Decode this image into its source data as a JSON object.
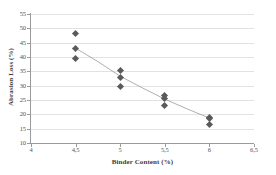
{
  "chart_data": {
    "type": "scatter",
    "title": "",
    "xlabel": "Binder Content (%)",
    "ylabel": "Abrasion Loss (%)",
    "xlim": [
      4,
      6.5
    ],
    "ylim": [
      10,
      55
    ],
    "xticks": [
      4,
      4.5,
      5,
      5.5,
      6,
      6.5
    ],
    "yticks": [
      10,
      15,
      20,
      25,
      30,
      35,
      40,
      45,
      50,
      55
    ],
    "xtick_labels": [
      "4",
      "4,5",
      "5",
      "5,5",
      "6",
      "6,5"
    ],
    "ytick_labels": [
      "10",
      "15",
      "20",
      "25",
      "30",
      "35",
      "40",
      "45",
      "50",
      "55"
    ],
    "grid": "horizontal",
    "legend": "none",
    "marker_shape": "diamond",
    "marker_color": "#5a5a5a",
    "trendline_color": "#9b9b9b",
    "points": [
      {
        "x": 4.5,
        "y": 48.3
      },
      {
        "x": 4.5,
        "y": 43.1
      },
      {
        "x": 4.5,
        "y": 39.4
      },
      {
        "x": 5.0,
        "y": 35.2
      },
      {
        "x": 5.0,
        "y": 32.7
      },
      {
        "x": 5.0,
        "y": 29.7
      },
      {
        "x": 5.5,
        "y": 26.7
      },
      {
        "x": 5.5,
        "y": 25.5
      },
      {
        "x": 5.5,
        "y": 23.2
      },
      {
        "x": 6.0,
        "y": 18.9
      },
      {
        "x": 6.0,
        "y": 18.4
      },
      {
        "x": 6.0,
        "y": 16.3
      }
    ],
    "trendline": [
      {
        "x": 4.5,
        "y": 43.1
      },
      {
        "x": 4.75,
        "y": 38.4
      },
      {
        "x": 5.0,
        "y": 33.3
      },
      {
        "x": 5.25,
        "y": 29.2
      },
      {
        "x": 5.5,
        "y": 25.3
      },
      {
        "x": 5.75,
        "y": 21.9
      },
      {
        "x": 6.0,
        "y": 18.7
      }
    ]
  }
}
